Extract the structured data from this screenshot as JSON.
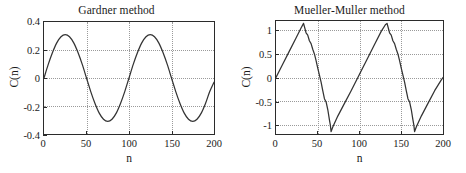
{
  "figure": {
    "background": "#ffffff",
    "axis_color": "#2b2b2b",
    "grid_color": "#9a9a9a",
    "curve_color": "#333333"
  },
  "chart_data": [
    {
      "type": "line",
      "title": "Gardner method",
      "xlabel": "n",
      "ylabel": "C(n)",
      "xlim": [
        0,
        200
      ],
      "ylim": [
        -0.4,
        0.4
      ],
      "xticks": [
        0,
        50,
        100,
        150,
        200
      ],
      "xticklabels": [
        "0",
        "50",
        "100",
        "150",
        "200"
      ],
      "yticks": [
        -0.4,
        -0.2,
        0,
        0.2,
        0.4
      ],
      "yticklabels": [
        "-0.4",
        "-0.2",
        "0",
        "0.2",
        "0.4"
      ],
      "grid": true,
      "legend": null,
      "series": [
        {
          "name": "C(n)",
          "description": "sinusoid, amplitude 0.31, period 100 samples, zero at n=0 rising",
          "x": [
            0,
            5,
            10,
            15,
            20,
            25,
            30,
            35,
            40,
            45,
            50,
            55,
            60,
            65,
            70,
            75,
            80,
            85,
            90,
            95,
            100,
            105,
            110,
            115,
            120,
            125,
            130,
            135,
            140,
            145,
            150,
            155,
            160,
            165,
            170,
            175,
            180,
            185,
            190,
            195,
            200
          ],
          "y": [
            0.0,
            0.097,
            0.182,
            0.251,
            0.295,
            0.31,
            0.295,
            0.251,
            0.182,
            0.097,
            0.0,
            -0.097,
            -0.182,
            -0.251,
            -0.295,
            -0.31,
            -0.295,
            -0.251,
            -0.182,
            -0.097,
            0.0,
            0.097,
            0.182,
            0.251,
            0.295,
            0.31,
            0.295,
            0.251,
            0.182,
            0.097,
            0.0,
            -0.097,
            -0.182,
            -0.251,
            -0.295,
            -0.31,
            -0.295,
            -0.251,
            -0.182,
            -0.097,
            -0.03
          ]
        }
      ]
    },
    {
      "type": "line",
      "title": "Mueller-Muller method",
      "xlabel": "n",
      "ylabel": "C(n)",
      "xlim": [
        0,
        200
      ],
      "ylim": [
        -1.2,
        1.2
      ],
      "xticks": [
        0,
        50,
        100,
        150,
        200
      ],
      "xticklabels": [
        "0",
        "50",
        "100",
        "150",
        "200"
      ],
      "yticks": [
        -1,
        -0.5,
        0,
        0.5,
        1
      ],
      "yticklabels": [
        "-1",
        "-0.5",
        "0",
        "0.5",
        "1"
      ],
      "grid": true,
      "legend": null,
      "series": [
        {
          "name": "C(n)",
          "description": "sawtooth, amplitude 1.15, period 100 samples, slow linear rise then stepped steep fall",
          "x": [
            0,
            8,
            16,
            24,
            30,
            33,
            36,
            38,
            40,
            42,
            44,
            46,
            48,
            50,
            52,
            54,
            56,
            58,
            60,
            62,
            64,
            65,
            66,
            68,
            74,
            82,
            90,
            100,
            110,
            118,
            126,
            131,
            133,
            136,
            138,
            140,
            142,
            144,
            146,
            148,
            150,
            152,
            154,
            156,
            158,
            160,
            162,
            164,
            165,
            166,
            168,
            174,
            182,
            190,
            198,
            200
          ],
          "y": [
            0.0,
            0.28,
            0.56,
            0.84,
            1.05,
            1.15,
            0.95,
            0.9,
            0.78,
            0.72,
            0.6,
            0.5,
            0.36,
            0.2,
            0.05,
            -0.1,
            -0.28,
            -0.45,
            -0.52,
            -0.68,
            -0.9,
            -1.0,
            -1.15,
            -1.05,
            -0.82,
            -0.55,
            -0.28,
            0.07,
            0.42,
            0.7,
            0.98,
            1.12,
            1.15,
            0.95,
            0.9,
            0.78,
            0.72,
            0.6,
            0.5,
            0.36,
            0.2,
            0.05,
            -0.1,
            -0.28,
            -0.45,
            -0.52,
            -0.68,
            -0.9,
            -1.0,
            -1.15,
            -1.05,
            -0.82,
            -0.55,
            -0.28,
            -0.05,
            0.0
          ]
        }
      ]
    }
  ]
}
